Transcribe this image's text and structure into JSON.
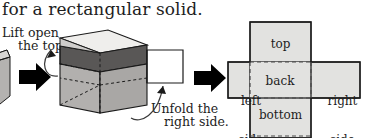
{
  "figure": {
    "heading": "for a rectangular solid.",
    "caption_lift": {
      "line1": "Lift open",
      "line2": "the top."
    },
    "caption_unfold": {
      "line1": "Unfold the",
      "line2": "right side."
    }
  },
  "net": {
    "panels": [
      {
        "id": "top",
        "label": "top"
      },
      {
        "id": "left-side",
        "label_line1": "left",
        "label_line2": "side"
      },
      {
        "id": "back",
        "label": "back"
      },
      {
        "id": "right-side",
        "label_line1": "right",
        "label_line2": "side"
      },
      {
        "id": "bottom",
        "label": "bottom"
      }
    ]
  },
  "colors": {
    "panel_fill": "#e2e2e0",
    "outline": "#1a1a1a",
    "fold_line": "#6b6b6b",
    "box_lid": "#efeeec",
    "box_interior": "#595756",
    "box_front": "#a9a7a5",
    "box_side": "#8d8b89",
    "flap_white": "#ffffff",
    "arrow_black": "#000000"
  },
  "icons": {
    "block_arrow_1": "right-block-arrow-icon",
    "block_arrow_2": "right-block-arrow-icon",
    "curved_arrow_lid": "curved-arrow-icon",
    "curved_arrow_flap": "curved-arrow-icon"
  }
}
